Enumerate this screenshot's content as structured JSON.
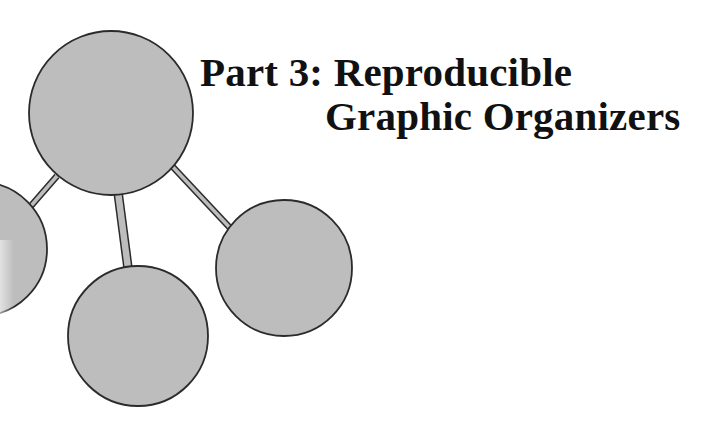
{
  "title": {
    "line1": "Part 3: Reproducible",
    "line2": "Graphic Organizers"
  },
  "colors": {
    "node_fill": "#bdbdbd",
    "node_stroke": "#2b2b2b",
    "text": "#111111",
    "background": "#ffffff"
  },
  "diagram": {
    "type": "cluster-web",
    "central_node": {
      "cx": 111,
      "cy": 113,
      "r": 82
    },
    "child_nodes": [
      {
        "name": "left",
        "cx": -20,
        "cy": 249,
        "r": 67
      },
      {
        "name": "bottom",
        "cx": 138,
        "cy": 336,
        "r": 70
      },
      {
        "name": "right",
        "cx": 284,
        "cy": 268,
        "r": 68
      }
    ],
    "connectors": [
      {
        "to": "left",
        "x1": 57,
        "y1": 176,
        "x2": 30,
        "y2": 207,
        "width": 5
      },
      {
        "to": "bottom",
        "x1": 118,
        "y1": 194,
        "x2": 128,
        "y2": 267,
        "width": 8
      },
      {
        "to": "right",
        "x1": 172,
        "y1": 167,
        "x2": 231,
        "y2": 229,
        "width": 5
      }
    ]
  }
}
